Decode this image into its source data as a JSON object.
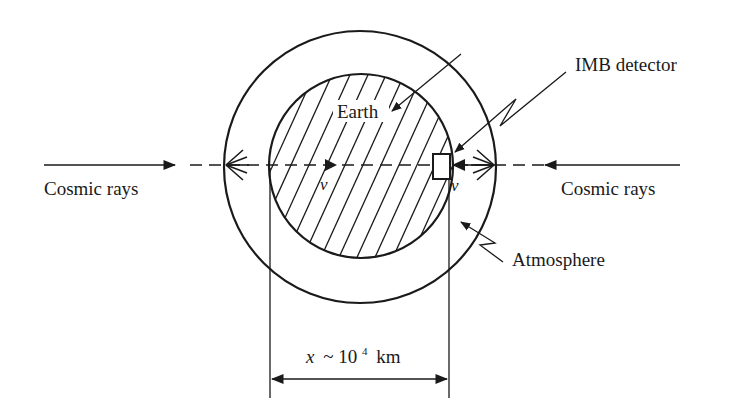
{
  "diagram": {
    "colors": {
      "ink": "#1a1a1a",
      "background": "#ffffff"
    },
    "labels": {
      "earth": "Earth",
      "detector": "IMB detector",
      "atmosphere": "Atmosphere",
      "cosmic_rays_left": "Cosmic rays",
      "cosmic_rays_right": "Cosmic rays",
      "neutrino_left": "ν",
      "neutrino_right": "ν",
      "distance_var": "x",
      "distance_approx": "~ 10",
      "distance_exp": "4",
      "distance_unit": "km"
    },
    "geometry": {
      "center": [
        361,
        167
      ],
      "outer_radius": 137,
      "inner_radius": 92,
      "axis_y": 165
    }
  }
}
